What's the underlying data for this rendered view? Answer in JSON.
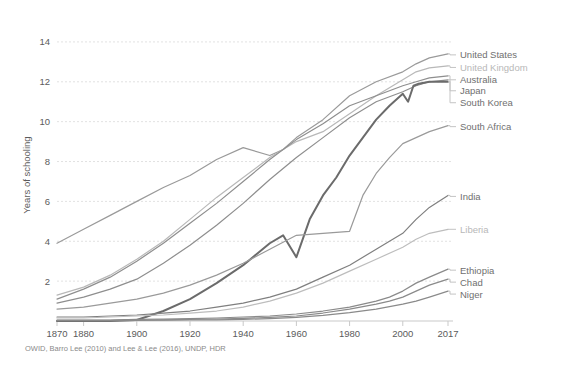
{
  "chart_data": {
    "type": "line",
    "title": "",
    "subtitle": "",
    "xlabel": "",
    "ylabel": "Years of schooling",
    "xlim": [
      1870,
      2017
    ],
    "ylim": [
      0,
      15
    ],
    "grid": true,
    "legend_position": "right-inline-labels",
    "source": "OWID, Barro Lee (2010) and Lee & Lee (2016), UNDP, HDR",
    "xticks": [
      "1870",
      "1880",
      "1900",
      "1920",
      "1940",
      "1960",
      "1980",
      "2000",
      "2017"
    ],
    "xtick_values": [
      1870,
      1880,
      1900,
      1920,
      1940,
      1960,
      1980,
      2000,
      2017
    ],
    "yticks": [
      "2",
      "4",
      "6",
      "8",
      "10",
      "12",
      "14"
    ],
    "ytick_values": [
      2,
      4,
      6,
      8,
      10,
      12,
      14
    ],
    "series": [
      {
        "name": "United States",
        "color": "#9a9a9a",
        "width": 1.2,
        "faded": false,
        "label_y": 13.35,
        "x": [
          1870,
          1880,
          1890,
          1900,
          1910,
          1920,
          1930,
          1940,
          1950,
          1955,
          1960,
          1970,
          1980,
          1990,
          2000,
          2005,
          2010,
          2017
        ],
        "y": [
          3.9,
          4.6,
          5.3,
          6.0,
          6.7,
          7.3,
          8.1,
          8.7,
          8.3,
          8.6,
          9.2,
          10.1,
          11.3,
          12.0,
          12.5,
          12.9,
          13.2,
          13.4
        ]
      },
      {
        "name": "United Kingdom",
        "color": "#b8b8b8",
        "width": 1.2,
        "faded": true,
        "label_y": 12.72,
        "x": [
          1870,
          1880,
          1890,
          1900,
          1910,
          1920,
          1930,
          1940,
          1950,
          1960,
          1970,
          1980,
          1990,
          2000,
          2005,
          2010,
          2017
        ],
        "y": [
          1.3,
          1.7,
          2.3,
          3.1,
          4.0,
          5.1,
          6.2,
          7.2,
          8.2,
          9.0,
          9.5,
          10.4,
          11.3,
          12.1,
          12.5,
          12.7,
          12.8
        ]
      },
      {
        "name": "Australia",
        "color": "#8e8e8e",
        "width": 1.2,
        "faded": false,
        "label_y": 12.1,
        "x": [
          1870,
          1880,
          1890,
          1900,
          1910,
          1920,
          1930,
          1940,
          1950,
          1960,
          1970,
          1980,
          1990,
          2000,
          2005,
          2010,
          2017
        ],
        "y": [
          1.1,
          1.6,
          2.2,
          3.0,
          3.9,
          4.9,
          5.9,
          7.0,
          8.1,
          9.1,
          9.9,
          10.8,
          11.3,
          11.8,
          12.0,
          12.2,
          12.3
        ]
      },
      {
        "name": "Japan",
        "color": "#8e8e8e",
        "width": 1.2,
        "faded": false,
        "label_y": 11.55,
        "x": [
          1870,
          1880,
          1890,
          1900,
          1910,
          1920,
          1930,
          1940,
          1950,
          1960,
          1970,
          1980,
          1990,
          2000,
          2005,
          2010,
          2017
        ],
        "y": [
          0.9,
          1.2,
          1.6,
          2.1,
          2.9,
          3.8,
          4.8,
          5.9,
          7.1,
          8.2,
          9.2,
          10.2,
          11.0,
          11.5,
          11.8,
          12.0,
          12.1
        ]
      },
      {
        "name": "South Korea",
        "color": "#6b6b6b",
        "width": 2.0,
        "faded": false,
        "label_y": 10.95,
        "x": [
          1870,
          1880,
          1890,
          1900,
          1910,
          1920,
          1930,
          1940,
          1950,
          1955,
          1960,
          1965,
          1970,
          1975,
          1980,
          1985,
          1990,
          1995,
          2000,
          2002,
          2004,
          2006,
          2010,
          2017
        ],
        "y": [
          0.0,
          0.0,
          0.0,
          0.05,
          0.5,
          1.1,
          1.9,
          2.8,
          3.9,
          4.3,
          3.2,
          5.1,
          6.3,
          7.2,
          8.3,
          9.2,
          10.1,
          10.8,
          11.4,
          11.0,
          11.8,
          11.9,
          12.0,
          12.0
        ]
      },
      {
        "name": "South Africa",
        "color": "#9a9a9a",
        "width": 1.2,
        "faded": false,
        "label_y": 9.75,
        "x": [
          1870,
          1880,
          1890,
          1900,
          1910,
          1920,
          1930,
          1940,
          1950,
          1960,
          1970,
          1980,
          1985,
          1990,
          1995,
          2000,
          2005,
          2010,
          2017
        ],
        "y": [
          0.6,
          0.7,
          0.9,
          1.1,
          1.4,
          1.8,
          2.3,
          2.9,
          3.6,
          4.3,
          4.4,
          4.5,
          6.3,
          7.4,
          8.2,
          8.9,
          9.2,
          9.5,
          9.8
        ]
      },
      {
        "name": "India",
        "color": "#7f7f7f",
        "width": 1.2,
        "faded": false,
        "label_y": 6.25,
        "x": [
          1870,
          1880,
          1890,
          1900,
          1910,
          1920,
          1930,
          1940,
          1950,
          1960,
          1970,
          1980,
          1990,
          2000,
          2005,
          2010,
          2017
        ],
        "y": [
          0.2,
          0.2,
          0.25,
          0.3,
          0.4,
          0.5,
          0.7,
          0.9,
          1.2,
          1.6,
          2.2,
          2.8,
          3.6,
          4.4,
          5.1,
          5.7,
          6.3
        ]
      },
      {
        "name": "Liberia",
        "color": "#bdbdbd",
        "width": 1.2,
        "faded": true,
        "label_y": 4.6,
        "x": [
          1870,
          1880,
          1890,
          1900,
          1910,
          1920,
          1930,
          1940,
          1950,
          1960,
          1970,
          1980,
          1990,
          2000,
          2005,
          2010,
          2017
        ],
        "y": [
          0.15,
          0.15,
          0.2,
          0.25,
          0.3,
          0.4,
          0.5,
          0.7,
          1.0,
          1.4,
          1.9,
          2.5,
          3.1,
          3.7,
          4.1,
          4.4,
          4.6
        ]
      },
      {
        "name": "Ethiopia",
        "color": "#8a8a8a",
        "width": 1.2,
        "faded": false,
        "label_y": 2.55,
        "x": [
          1870,
          1880,
          1890,
          1900,
          1910,
          1920,
          1930,
          1940,
          1950,
          1960,
          1970,
          1980,
          1990,
          1995,
          2000,
          2005,
          2010,
          2017
        ],
        "y": [
          0.05,
          0.05,
          0.05,
          0.08,
          0.1,
          0.12,
          0.15,
          0.2,
          0.25,
          0.35,
          0.5,
          0.7,
          1.0,
          1.2,
          1.5,
          1.9,
          2.2,
          2.6
        ]
      },
      {
        "name": "Chad",
        "color": "#8a8a8a",
        "width": 1.2,
        "faded": false,
        "label_y": 1.95,
        "x": [
          1870,
          1880,
          1890,
          1900,
          1910,
          1920,
          1930,
          1940,
          1950,
          1960,
          1970,
          1980,
          1990,
          1995,
          2000,
          2005,
          2010,
          2017
        ],
        "y": [
          0.03,
          0.03,
          0.03,
          0.05,
          0.06,
          0.08,
          0.1,
          0.13,
          0.18,
          0.25,
          0.4,
          0.6,
          0.85,
          1.0,
          1.2,
          1.5,
          1.8,
          2.1
        ]
      },
      {
        "name": "Niger",
        "color": "#8a8a8a",
        "width": 1.2,
        "faded": false,
        "label_y": 1.35,
        "x": [
          1870,
          1880,
          1890,
          1900,
          1910,
          1920,
          1930,
          1940,
          1950,
          1960,
          1970,
          1980,
          1990,
          1995,
          2000,
          2005,
          2010,
          2017
        ],
        "y": [
          0.02,
          0.02,
          0.02,
          0.03,
          0.04,
          0.05,
          0.06,
          0.08,
          0.12,
          0.18,
          0.28,
          0.42,
          0.6,
          0.72,
          0.85,
          1.0,
          1.2,
          1.5
        ]
      }
    ]
  }
}
